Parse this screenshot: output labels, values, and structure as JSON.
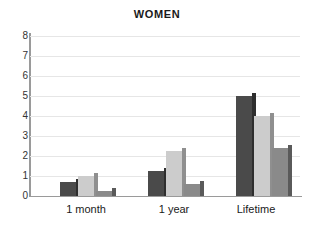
{
  "chart_data": {
    "type": "bar",
    "title": "WOMEN",
    "xlabel": "",
    "ylabel": "",
    "ylim": [
      0,
      8
    ],
    "yticks": [
      0,
      1,
      2,
      3,
      4,
      5,
      6,
      7,
      8
    ],
    "grid": true,
    "legend": "none",
    "categories": [
      "1 month",
      "1 year",
      "Lifetime"
    ],
    "series": [
      {
        "name": "series-1",
        "color": "#4a4a4a",
        "side_color": "#2e2e2e",
        "values": [
          0.7,
          1.25,
          5.0
        ]
      },
      {
        "name": "series-2",
        "color": "#cccccc",
        "side_color": "#8f8f8f",
        "values": [
          1.0,
          2.25,
          4.0
        ]
      },
      {
        "name": "series-3",
        "color": "#8a8a8a",
        "side_color": "#5a5a5a",
        "values": [
          0.25,
          0.6,
          2.4
        ]
      }
    ]
  },
  "axis": {
    "tick_0": "0",
    "tick_1": "1",
    "tick_2": "2",
    "tick_3": "3",
    "tick_4": "4",
    "tick_5": "5",
    "tick_6": "6",
    "tick_7": "7",
    "tick_8": "8"
  },
  "category_labels": {
    "c0": "1 month",
    "c1": "1 year",
    "c2": "Lifetime"
  }
}
